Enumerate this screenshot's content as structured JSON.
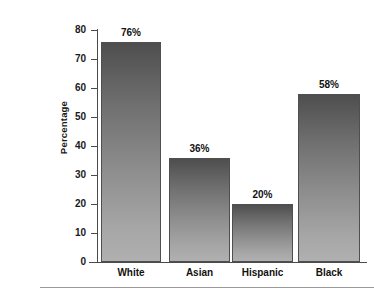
{
  "chart_data": {
    "type": "bar",
    "title": "",
    "subtitle": "",
    "xlabel": "",
    "ylabel": "Percentage",
    "categories": [
      "White",
      "Asian",
      "Hispanic",
      "Black"
    ],
    "values": [
      76,
      36,
      20,
      58
    ],
    "value_labels": [
      "76%",
      "36%",
      "20%",
      "58%"
    ],
    "ylim": [
      0,
      80
    ],
    "ytick_labels": [
      "80",
      "70",
      "60",
      "50",
      "40",
      "30",
      "20",
      "10",
      "0"
    ],
    "ytick_values": [
      80,
      70,
      60,
      50,
      40,
      30,
      20,
      10,
      0
    ],
    "grid": false,
    "legend": null,
    "legend_position": "none",
    "annotations": []
  },
  "style": {
    "bar_fill_top": "#4e4e4e",
    "bar_fill_bottom": "#b0b0b0",
    "bar_border": "#4f4f4f",
    "axis_color": "#4a4a4a",
    "text_color": "#111111",
    "background": "#ffffff",
    "rule_color": "#9a9a9a"
  }
}
